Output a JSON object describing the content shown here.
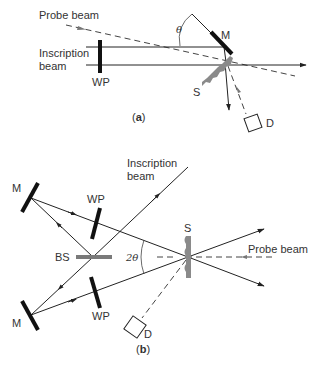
{
  "panel_a": {
    "caption": "(a)",
    "caption_bold": "a",
    "labels": {
      "probe_beam": "Probe beam",
      "inscription_beam_line1": "Inscription",
      "inscription_beam_line2": "beam",
      "waveplate": "WP",
      "mirror": "M",
      "sample": "S",
      "detector": "D",
      "angle": "θ"
    }
  },
  "panel_b": {
    "caption": "(b)",
    "caption_bold": "b",
    "labels": {
      "inscription_beam_line1": "Inscription",
      "inscription_beam_line2": "beam",
      "mirror_top": "M",
      "mirror_bottom": "M",
      "waveplate_top": "WP",
      "waveplate_bottom": "WP",
      "beam_splitter": "BS",
      "sample": "S",
      "probe_beam": "Probe beam",
      "detector": "D",
      "angle": "2θ"
    }
  },
  "colors": {
    "line": "#222222",
    "optic": "#111111",
    "sample": "#8a8a8a",
    "beamsplitter": "#7a7a7a"
  }
}
